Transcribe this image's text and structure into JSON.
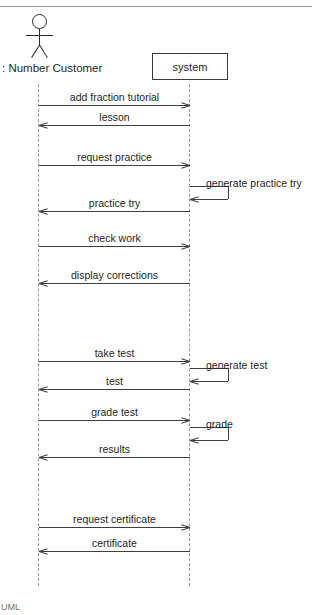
{
  "diagram": {
    "type": "uml-sequence-diagram",
    "actor": {
      "label": ": Number Customer",
      "icon": "stick-figure-actor-icon",
      "lifeline_x": 39
    },
    "participant": {
      "label": "system",
      "lifeline_x": 190
    },
    "messages": [
      {
        "label": "add fraction tutorial",
        "direction": "right",
        "y": 105,
        "label_y": 91
      },
      {
        "label": "lesson",
        "direction": "left",
        "y": 125,
        "label_y": 111
      },
      {
        "label": "request practice",
        "direction": "right",
        "y": 165,
        "label_y": 151
      },
      {
        "label": "practice try",
        "direction": "left",
        "y": 211,
        "label_y": 197
      },
      {
        "label": "check work",
        "direction": "right",
        "y": 246,
        "label_y": 232
      },
      {
        "label": "display corrections",
        "direction": "left",
        "y": 283,
        "label_y": 269
      },
      {
        "label": "take test",
        "direction": "right",
        "y": 361,
        "label_y": 347
      },
      {
        "label": "test",
        "direction": "left",
        "y": 389,
        "label_y": 375
      },
      {
        "label": "grade test",
        "direction": "right",
        "y": 420,
        "label_y": 406
      },
      {
        "label": "results",
        "direction": "left",
        "y": 457,
        "label_y": 443
      },
      {
        "label": "request certificate",
        "direction": "right",
        "y": 527,
        "label_y": 513
      },
      {
        "label": "certificate",
        "direction": "left",
        "y": 551,
        "label_y": 537
      }
    ],
    "self_calls": [
      {
        "label": "generate practice try",
        "top_y": 186,
        "bottom_y": 199,
        "width": 38,
        "label_x": 206,
        "label_y": 177
      },
      {
        "label": "generate test",
        "top_y": 368,
        "bottom_y": 381,
        "width": 38,
        "label_x": 206,
        "label_y": 359
      },
      {
        "label": "grade",
        "top_y": 427,
        "bottom_y": 440,
        "width": 38,
        "label_x": 206,
        "label_y": 418
      }
    ],
    "lifeline_top": 84,
    "lifeline_bottom": 586,
    "bottom_text_fragment": "UML",
    "colors": {
      "line": "#3f3f3f",
      "lifeline": "#9b9b9b",
      "text": "#1f1f1f",
      "background": "#ffffff",
      "rule": "#9a9a9a"
    }
  }
}
